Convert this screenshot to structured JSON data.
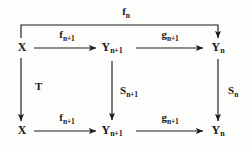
{
  "diagram": {
    "kind": "commutative-diagram",
    "stroke_color": "#1a1a1a",
    "background_color": "#fdfdfb",
    "nodes": [
      {
        "id": "x-top",
        "base": "X",
        "sub": "",
        "x": 22,
        "y": 48
      },
      {
        "id": "y-np1-top",
        "base": "Y",
        "sub": "n+1",
        "x": 112,
        "y": 48
      },
      {
        "id": "y-n-top",
        "base": "Y",
        "sub": "n",
        "x": 218,
        "y": 48
      },
      {
        "id": "x-bottom",
        "base": "X",
        "sub": "",
        "x": 22,
        "y": 131
      },
      {
        "id": "y-np1-bot",
        "base": "Y",
        "sub": "n+1",
        "x": 112,
        "y": 131
      },
      {
        "id": "y-n-bot",
        "base": "Y",
        "sub": "n",
        "x": 218,
        "y": 131
      }
    ],
    "edges": [
      {
        "id": "f-n-outer",
        "base": "f",
        "sub": "n",
        "from": "x-top",
        "to": "y-n-top",
        "label_x": 126,
        "label_y": 13,
        "orientation": "path"
      },
      {
        "id": "f-np1-top",
        "base": "f",
        "sub": "n+1",
        "from": "x-top",
        "to": "y-np1-top",
        "label_x": 67,
        "label_y": 36,
        "orientation": "horizontal"
      },
      {
        "id": "g-np1-top",
        "base": "g",
        "sub": "n+1",
        "from": "y-np1-top",
        "to": "y-n-top",
        "label_x": 170,
        "label_y": 36,
        "orientation": "horizontal"
      },
      {
        "id": "T-left",
        "base": "T",
        "sub": "",
        "from": "x-top",
        "to": "x-bottom",
        "label_x": 35,
        "label_y": 88,
        "orientation": "vertical"
      },
      {
        "id": "S-np1-middle",
        "base": "S",
        "sub": "n+1",
        "from": "y-np1-top",
        "to": "y-np1-bot",
        "label_x": 120,
        "label_y": 92,
        "orientation": "vertical"
      },
      {
        "id": "S-n-right",
        "base": "S",
        "sub": "n",
        "from": "y-n-top",
        "to": "y-n-bot",
        "label_x": 228,
        "label_y": 92,
        "orientation": "vertical"
      },
      {
        "id": "f-np1-bottom",
        "base": "f",
        "sub": "n+1",
        "from": "x-bottom",
        "to": "y-np1-bot",
        "label_x": 67,
        "label_y": 119,
        "orientation": "horizontal"
      },
      {
        "id": "g-np1-bottom",
        "base": "g",
        "sub": "n+1",
        "from": "y-np1-bot",
        "to": "y-n-bot",
        "label_x": 170,
        "label_y": 119,
        "orientation": "horizontal"
      }
    ]
  }
}
